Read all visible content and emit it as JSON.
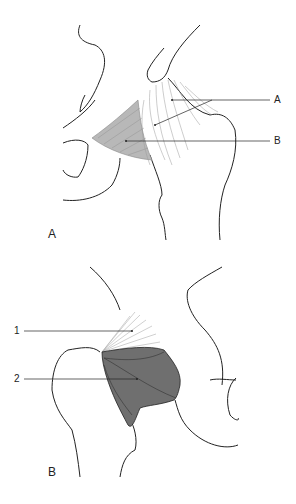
{
  "figure": {
    "panels": [
      {
        "id": "A",
        "panel_label": "A",
        "callouts": [
          {
            "label": "A",
            "description": "fibrous ligament bands (two leader lines)"
          },
          {
            "label": "B",
            "description": "lightly shaded fan-shaped ligament"
          }
        ]
      },
      {
        "id": "B",
        "panel_label": "B",
        "callouts": [
          {
            "label": "1",
            "description": "fine radiating fibers"
          },
          {
            "label": "2",
            "description": "dark shaded ligament region"
          }
        ]
      }
    ]
  },
  "colors": {
    "outline": "#222222",
    "fiber": "#9a9a9a",
    "light_shade": "#b8b8b8",
    "dark_shade": "#6f6f6f",
    "background": "#ffffff"
  }
}
